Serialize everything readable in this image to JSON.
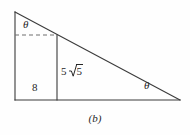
{
  "figure": {
    "caption": "(b)",
    "shape": "right-triangle-with-inner-altitude",
    "stroke_color": "#3a3a3a",
    "dashed_stroke_color": "#6e6e6e",
    "background_color": "#fefefe",
    "vertices": {
      "top": [
        15,
        12
      ],
      "bottom_left": [
        15,
        100
      ],
      "bottom_right": [
        180,
        100
      ]
    },
    "inner_altitude": {
      "x": 57,
      "y_top": 35,
      "y_bottom": 100
    },
    "dashed_line": {
      "x_start": 15,
      "x_end": 57,
      "y": 35
    },
    "labels": {
      "theta_top": "θ",
      "theta_right": "θ",
      "base_length": "8",
      "height_coefficient": "5",
      "height_radicand": "5",
      "height_full": "5√5"
    }
  }
}
